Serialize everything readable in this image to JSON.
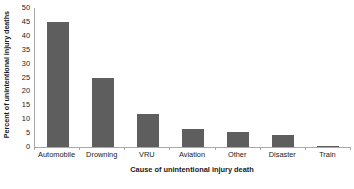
{
  "chart_data": {
    "type": "bar",
    "title": "",
    "subtitle": "",
    "xlabel": "Cause of unintentional injury death",
    "ylabel": "Percent of unintentional injury deaths",
    "categories": [
      "Automobile",
      "Drowning",
      "VRU",
      "Aviation",
      "Other",
      "Disaster",
      "Train"
    ],
    "values": [
      45,
      25,
      12,
      6.5,
      5.5,
      4.5,
      0.5
    ],
    "ylim": [
      0,
      50
    ],
    "yticks": [
      50,
      45,
      40,
      35,
      30,
      25,
      20,
      15,
      10,
      5,
      0
    ],
    "ytick_labels": [
      "50",
      "45",
      "40",
      "35",
      "30",
      "25",
      "20",
      "15",
      "10",
      "5",
      "0"
    ],
    "grid": false,
    "legend": null,
    "legend_position": "none",
    "bar_color": "#5e5e5e",
    "axis_color": "#a8a8a8",
    "background_color": "#ffffff",
    "annotations": []
  }
}
